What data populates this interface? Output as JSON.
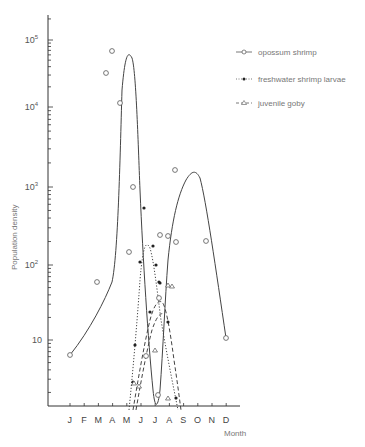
{
  "chart_data": {
    "type": "line",
    "title": "",
    "xlabel": "Month",
    "ylabel": "Population density",
    "yscale": "log",
    "ylim": [
      1.3,
      200000
    ],
    "grid": false,
    "legend_position": "top-right",
    "categories": [
      "J",
      "F",
      "M",
      "A",
      "M",
      "J",
      "J",
      "A",
      "S",
      "O",
      "N",
      "D"
    ],
    "y_ticks": [
      {
        "label": "10",
        "exp": "",
        "value": 10
      },
      {
        "label": "10",
        "exp": "2",
        "value": 100
      },
      {
        "label": "10",
        "exp": "3",
        "value": 1000
      },
      {
        "label": "10",
        "exp": "4",
        "value": 10000
      },
      {
        "label": "10",
        "exp": "5",
        "value": 100000
      }
    ],
    "series": [
      {
        "name": "opossum shrimp",
        "marker": "circle",
        "line_style": "solid",
        "points": [
          {
            "month": 1.0,
            "value": 6
          },
          {
            "month": 4.0,
            "value": 60
          },
          {
            "month": 4.85,
            "value": 35000
          },
          {
            "month": 5.0,
            "value": 70000
          },
          {
            "month": 5.3,
            "value": 14000
          },
          {
            "month": 5.85,
            "value": 1000
          },
          {
            "month": 5.75,
            "value": 130
          },
          {
            "month": 7.0,
            "value": 2
          },
          {
            "month": 7.5,
            "value": 6
          },
          {
            "month": 8.3,
            "value": 250
          },
          {
            "month": 8.6,
            "value": 200
          },
          {
            "month": 9.9,
            "value": 1800
          },
          {
            "month": 12.0,
            "value": 10
          }
        ]
      },
      {
        "name": "freshwater shrimp larvae",
        "marker": "dot",
        "line_style": "dotted",
        "points": [
          {
            "month": 6.1,
            "value": 3
          },
          {
            "month": 6.3,
            "value": 8
          },
          {
            "month": 6.6,
            "value": 100
          },
          {
            "month": 7.0,
            "value": 550
          },
          {
            "month": 7.6,
            "value": 120
          },
          {
            "month": 8.0,
            "value": 50
          },
          {
            "month": 8.6,
            "value": 60
          },
          {
            "month": 9.3,
            "value": 17
          },
          {
            "month": 9.8,
            "value": 1.6
          }
        ]
      },
      {
        "name": "juvenile goby",
        "marker": "triangle",
        "line_style": "dashed",
        "points": [
          {
            "month": 6.2,
            "value": 2.5
          },
          {
            "month": 6.6,
            "value": 6
          },
          {
            "month": 7.2,
            "value": 12
          },
          {
            "month": 7.7,
            "value": 30
          },
          {
            "month": 8.4,
            "value": 18
          },
          {
            "month": 8.7,
            "value": 40
          },
          {
            "month": 9.7,
            "value": 1.6
          }
        ]
      }
    ]
  },
  "legend": {
    "items": [
      {
        "label": "opossum shrimp",
        "symbol": "circle"
      },
      {
        "label": "freshwater shrimp larvae",
        "symbol": "dot"
      },
      {
        "label": "juvenile goby",
        "symbol": "triangle"
      }
    ]
  },
  "axes": {
    "x_title": "Month",
    "y_title": "Population density"
  }
}
